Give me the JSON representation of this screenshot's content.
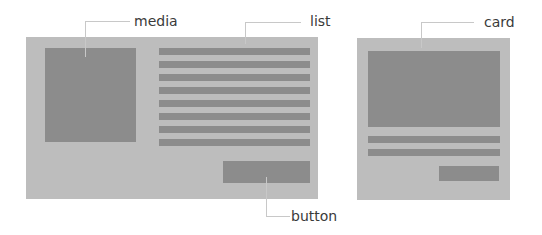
{
  "diagram": {
    "title": "",
    "colors": {
      "panel": "#bdbdbd",
      "block": "#8c8c8c",
      "leader": "#c8c8c8",
      "label": "#3a3a3a"
    },
    "labels": {
      "media": "media",
      "list": "list",
      "button": "button",
      "card": "card"
    },
    "layouts": [
      {
        "name": "media-list-layout",
        "components": [
          "media",
          "list",
          "button"
        ],
        "list_rows": 8
      },
      {
        "name": "card-layout",
        "components": [
          "card"
        ],
        "card_text_rows": 2
      }
    ]
  }
}
